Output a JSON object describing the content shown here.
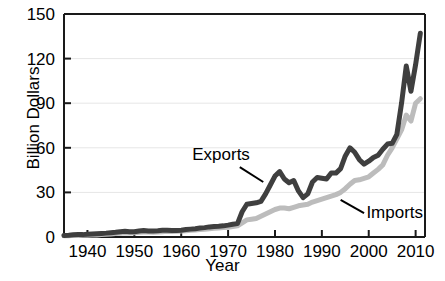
{
  "chart_data": {
    "type": "line",
    "title": "",
    "xlabel": "Year",
    "ylabel": "Billion Dollars",
    "xlim": [
      1935,
      2012
    ],
    "ylim": [
      0,
      150
    ],
    "xticks": [
      1940,
      1950,
      1960,
      1970,
      1980,
      1990,
      2000,
      2010
    ],
    "xticklabels": [
      "1940",
      "1950",
      "1960",
      "1970",
      "1980",
      "1990",
      "2000",
      "2010"
    ],
    "yticks": [
      0,
      30,
      60,
      90,
      120,
      150
    ],
    "yticklabels": [
      "0",
      "30",
      "60",
      "90",
      "120",
      "150"
    ],
    "grid": "horizontal",
    "legend_position": "inline-annotations",
    "colors": {
      "exports": "#3f3f3f",
      "imports": "#bcbcbc",
      "axis": "#1a1a1a",
      "grid": "#e6e6e6",
      "text": "#000000"
    },
    "annotations": [
      {
        "label": "Exports",
        "series": "Exports",
        "text_x": 1968.5,
        "text_y": 52,
        "leader_from_x": 1972.5,
        "leader_from_y": 47,
        "leader_to_x": 1977.5,
        "leader_to_y": 37
      },
      {
        "label": "Imports",
        "series": "Imports",
        "text_x": 1999.5,
        "text_y": 13,
        "leader_from_x": 1999.0,
        "leader_from_y": 16,
        "leader_to_x": 1994.0,
        "leader_to_y": 25
      }
    ],
    "x": [
      1935,
      1936,
      1937,
      1938,
      1939,
      1940,
      1941,
      1942,
      1943,
      1944,
      1945,
      1946,
      1947,
      1948,
      1949,
      1950,
      1951,
      1952,
      1953,
      1954,
      1955,
      1956,
      1957,
      1958,
      1959,
      1960,
      1961,
      1962,
      1963,
      1964,
      1965,
      1966,
      1967,
      1968,
      1969,
      1970,
      1971,
      1972,
      1973,
      1974,
      1975,
      1976,
      1977,
      1978,
      1979,
      1980,
      1981,
      1982,
      1983,
      1984,
      1985,
      1986,
      1987,
      1988,
      1989,
      1990,
      1991,
      1992,
      1993,
      1994,
      1995,
      1996,
      1997,
      1998,
      1999,
      2000,
      2001,
      2002,
      2003,
      2004,
      2005,
      2006,
      2007,
      2008,
      2009,
      2010,
      2011
    ],
    "series": [
      {
        "name": "Exports",
        "color": "#3f3f3f",
        "values": [
          1.0,
          1.2,
          1.5,
          1.7,
          1.6,
          1.8,
          2.0,
          2.2,
          2.4,
          2.6,
          2.9,
          3.2,
          3.6,
          3.8,
          3.6,
          3.5,
          4.0,
          4.3,
          4.1,
          4.0,
          4.2,
          4.5,
          4.6,
          4.4,
          4.3,
          4.6,
          5.0,
          5.3,
          5.6,
          6.0,
          6.3,
          6.8,
          7.0,
          7.2,
          7.5,
          8.0,
          8.6,
          9.0,
          17.0,
          22.0,
          22.5,
          23.0,
          24.0,
          29.0,
          35.0,
          41.0,
          44.0,
          39.0,
          36.5,
          38.0,
          31.0,
          26.5,
          29.0,
          37.0,
          40.0,
          39.5,
          39.0,
          43.0,
          43.0,
          46.0,
          54.5,
          60.0,
          57.0,
          52.0,
          49.0,
          51.0,
          53.5,
          55.0,
          59.0,
          62.5,
          63.0,
          69.0,
          90.0,
          115.0,
          98.0,
          116.0,
          137.0
        ]
      },
      {
        "name": "Imports",
        "color": "#bcbcbc",
        "values": [
          0.8,
          0.9,
          1.1,
          1.0,
          1.1,
          1.2,
          1.3,
          1.4,
          1.6,
          1.8,
          2.0,
          2.3,
          2.6,
          2.8,
          2.7,
          2.8,
          3.2,
          3.4,
          3.3,
          3.2,
          3.4,
          3.6,
          3.8,
          3.7,
          3.8,
          4.0,
          4.2,
          4.5,
          4.7,
          5.0,
          5.2,
          5.5,
          5.8,
          6.0,
          6.3,
          6.6,
          7.0,
          7.5,
          9.5,
          11.5,
          12.0,
          12.5,
          14.0,
          15.5,
          17.0,
          18.5,
          19.5,
          19.5,
          19.0,
          20.0,
          21.0,
          21.5,
          22.0,
          23.5,
          24.5,
          25.5,
          26.5,
          27.5,
          28.5,
          30.0,
          32.5,
          35.5,
          38.0,
          38.5,
          39.5,
          40.5,
          43.0,
          45.5,
          48.5,
          55.0,
          60.0,
          66.0,
          72.0,
          82.0,
          78.0,
          90.0,
          93.0
        ]
      }
    ]
  }
}
